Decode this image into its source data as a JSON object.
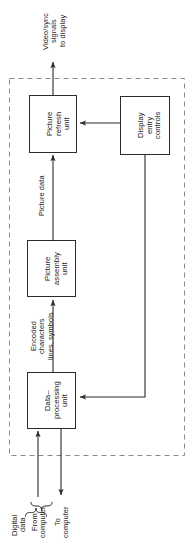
{
  "diagram": {
    "orientation": "rotated-90-ccw",
    "dashed_boundary": {
      "name": "display-subsystem-boundary",
      "style": "dashed",
      "color": "#7a7a7a"
    },
    "colors": {
      "line": "#2b2b2b",
      "dashed": "#8a8a8a",
      "text": "#1a1a1a",
      "background": "#ffffff"
    },
    "blocks": [
      {
        "id": "picture-refresh-unit",
        "label": "Picture\nrefresh\nunit"
      },
      {
        "id": "display-entry-controls",
        "label": "Display\nentry\ncontrols"
      },
      {
        "id": "picture-assembly-unit",
        "label": "Picture\nassembly\nunit"
      },
      {
        "id": "data-processing-unit",
        "label": "Data–\nprocessing\nunit"
      }
    ],
    "edge_labels": [
      {
        "id": "video-sync-output",
        "label": "Video/sync\nsignals\nto display"
      },
      {
        "id": "picture-data",
        "label": "Picture data"
      },
      {
        "id": "encoded-characters",
        "label": "Encoded\ncharacters\nlines, symbols"
      },
      {
        "id": "from-computer",
        "label": "From\ncomputer"
      },
      {
        "id": "to-computer",
        "label": "To\ncomputer"
      },
      {
        "id": "digital-data",
        "label": "Digital\ndata"
      }
    ],
    "connections": [
      {
        "id": "refresh-to-display",
        "from": "picture-refresh-unit",
        "to": "display-output",
        "label": "Video/sync signals to display"
      },
      {
        "id": "assembly-to-refresh",
        "from": "picture-assembly-unit",
        "to": "picture-refresh-unit",
        "label": "Picture data"
      },
      {
        "id": "controls-to-refresh",
        "from": "display-entry-controls",
        "to": "picture-refresh-unit",
        "label": ""
      },
      {
        "id": "dpu-to-assembly",
        "from": "data-processing-unit",
        "to": "picture-assembly-unit",
        "label": "Encoded characters lines, symbols"
      },
      {
        "id": "controls-to-dpu",
        "from": "display-entry-controls",
        "to": "data-processing-unit",
        "label": ""
      },
      {
        "id": "computer-to-dpu",
        "from": "computer",
        "to": "data-processing-unit",
        "label": "From computer"
      },
      {
        "id": "dpu-to-computer",
        "from": "data-processing-unit",
        "to": "computer",
        "label": "To computer"
      }
    ]
  }
}
